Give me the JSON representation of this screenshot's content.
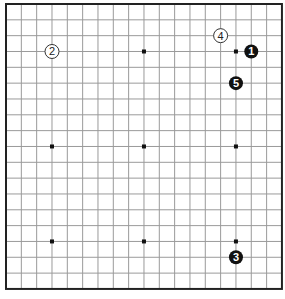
{
  "board": {
    "size": 19,
    "origin_x": 6,
    "origin_y": 4,
    "spacing_x": 15.33,
    "spacing_y": 15.83,
    "line_color": "#9a9a9a",
    "border_color": "#222222",
    "background": "#ffffff",
    "star_points": [
      [
        3,
        3
      ],
      [
        9,
        3
      ],
      [
        15,
        3
      ],
      [
        3,
        9
      ],
      [
        9,
        9
      ],
      [
        15,
        9
      ],
      [
        3,
        15
      ],
      [
        9,
        15
      ],
      [
        15,
        15
      ]
    ]
  },
  "stones": [
    {
      "move": "1",
      "color": "black",
      "col": 16,
      "row": 3
    },
    {
      "move": "2",
      "color": "white",
      "col": 3,
      "row": 3
    },
    {
      "move": "3",
      "color": "black",
      "col": 15,
      "row": 16
    },
    {
      "move": "4",
      "color": "white",
      "col": 14,
      "row": 2
    },
    {
      "move": "5",
      "color": "black",
      "col": 15,
      "row": 5
    }
  ]
}
